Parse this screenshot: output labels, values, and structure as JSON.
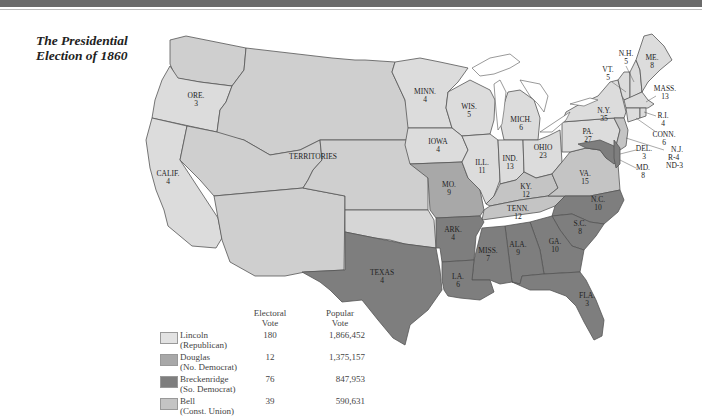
{
  "title": {
    "line1": "The Presidential",
    "line2": "Election of 1860"
  },
  "colors": {
    "lincoln": "#dcdcdc",
    "douglas": "#a8a8a8",
    "breckenridge": "#7e7e7e",
    "bell": "#c4c4c4",
    "territory": "#cfcfcf",
    "border": "#555555",
    "topbar": "#6a6a6a"
  },
  "states": [
    {
      "abbr": "ORE.",
      "ev": "3"
    },
    {
      "abbr": "CALIF.",
      "ev": "4"
    },
    {
      "abbr": "TERRITORIES",
      "ev": ""
    },
    {
      "abbr": "MINN.",
      "ev": "4"
    },
    {
      "abbr": "WIS.",
      "ev": "5"
    },
    {
      "abbr": "MICH.",
      "ev": "6"
    },
    {
      "abbr": "IOWA",
      "ev": "4"
    },
    {
      "abbr": "ILL.",
      "ev": "11"
    },
    {
      "abbr": "IND.",
      "ev": "13"
    },
    {
      "abbr": "OHIO",
      "ev": "23"
    },
    {
      "abbr": "MO.",
      "ev": "9"
    },
    {
      "abbr": "KY.",
      "ev": "12"
    },
    {
      "abbr": "TENN.",
      "ev": "12"
    },
    {
      "abbr": "VA.",
      "ev": "15"
    },
    {
      "abbr": "PA.",
      "ev": "27"
    },
    {
      "abbr": "N.Y.",
      "ev": "35"
    },
    {
      "abbr": "VT.",
      "ev": "5"
    },
    {
      "abbr": "N.H.",
      "ev": "5"
    },
    {
      "abbr": "ME.",
      "ev": "8"
    },
    {
      "abbr": "MASS.",
      "ev": "13"
    },
    {
      "abbr": "R.I.",
      "ev": "4"
    },
    {
      "abbr": "CONN.",
      "ev": "6"
    },
    {
      "abbr": "N.J.",
      "ev": "R-4"
    },
    {
      "abbr": "",
      "ev": "ND-3"
    },
    {
      "abbr": "DEL.",
      "ev": "3"
    },
    {
      "abbr": "MD.",
      "ev": "8"
    },
    {
      "abbr": "N.C.",
      "ev": "10"
    },
    {
      "abbr": "S.C.",
      "ev": "8"
    },
    {
      "abbr": "GA.",
      "ev": "10"
    },
    {
      "abbr": "ALA.",
      "ev": "9"
    },
    {
      "abbr": "MISS.",
      "ev": "7"
    },
    {
      "abbr": "LA.",
      "ev": "6"
    },
    {
      "abbr": "ARK.",
      "ev": "4"
    },
    {
      "abbr": "TEXAS",
      "ev": "4"
    },
    {
      "abbr": "FLA.",
      "ev": "3"
    }
  ],
  "legend": {
    "col_electoral": "Electoral",
    "col_electoral2": "Vote",
    "col_popular": "Popular",
    "col_popular2": "Vote",
    "rows": [
      {
        "name": "Lincoln",
        "party": "(Republican)",
        "electoral": "180",
        "popular": "1,866,452"
      },
      {
        "name": "Douglas",
        "party": "(No. Democrat)",
        "electoral": "12",
        "popular": "1,375,157"
      },
      {
        "name": "Breckenridge",
        "party": "(So. Democrat)",
        "electoral": "76",
        "popular": "847,953"
      },
      {
        "name": "Bell",
        "party": "(Const. Union)",
        "electoral": "39",
        "popular": "590,631"
      }
    ]
  }
}
